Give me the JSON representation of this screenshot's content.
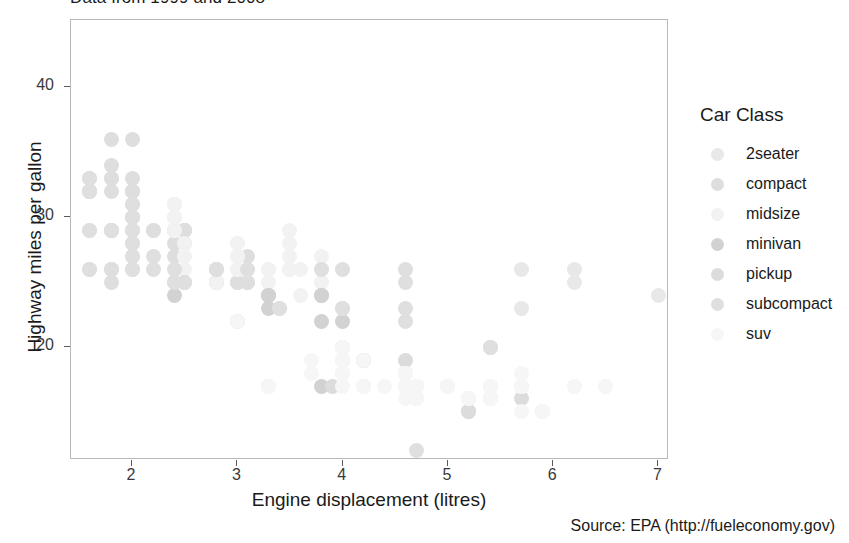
{
  "subtitle": "Data from 1999 and 2008",
  "caption": "Source: EPA (http://fueleconomy.gov)",
  "axes": {
    "xlabel": "Engine displacement (litres)",
    "ylabel": "Highway miles per gallon",
    "xticks": [
      "2",
      "3",
      "4",
      "5",
      "6",
      "7"
    ],
    "yticks": [
      "20",
      "30",
      "40"
    ]
  },
  "legend": {
    "title": "Car Class",
    "items": [
      {
        "label": "2seater",
        "color": "#e8e8e8"
      },
      {
        "label": "compact",
        "color": "#dedede"
      },
      {
        "label": "midsize",
        "color": "#f2f2f2"
      },
      {
        "label": "minivan",
        "color": "#d2d2d2"
      },
      {
        "label": "pickup",
        "color": "#dcdcdc"
      },
      {
        "label": "subcompact",
        "color": "#dfdfdf"
      },
      {
        "label": "suv",
        "color": "#f6f6f6"
      }
    ]
  },
  "chart_data": {
    "type": "scatter",
    "title": "",
    "subtitle": "Data from 1999 and 2008",
    "caption": "Source: EPA (http://fueleconomy.gov)",
    "xlabel": "Engine displacement (litres)",
    "ylabel": "Highway miles per gallon",
    "xlim": [
      1.42,
      7.1
    ],
    "ylim": [
      11.3,
      45.2
    ],
    "xticks": [
      2,
      3,
      4,
      5,
      6,
      7
    ],
    "yticks": [
      20,
      30,
      40
    ],
    "grid": false,
    "legend_position": "right",
    "legend_title": "Car Class",
    "color_by": "class",
    "point_alpha": 0.35,
    "series": [
      {
        "name": "2seater",
        "color": "#e8e8e8",
        "points": [
          [
            6.2,
            26
          ],
          [
            6.2,
            25
          ],
          [
            7.0,
            24
          ],
          [
            5.7,
            26
          ],
          [
            5.7,
            23
          ]
        ]
      },
      {
        "name": "compact",
        "color": "#dedede",
        "points": [
          [
            1.8,
            29
          ],
          [
            1.8,
            29
          ],
          [
            2.0,
            31
          ],
          [
            2.0,
            30
          ],
          [
            2.8,
            26
          ],
          [
            2.8,
            26
          ],
          [
            3.1,
            27
          ],
          [
            1.8,
            26
          ],
          [
            1.8,
            25
          ],
          [
            2.0,
            28
          ],
          [
            2.0,
            27
          ],
          [
            2.8,
            25
          ],
          [
            2.8,
            25
          ],
          [
            3.1,
            25
          ],
          [
            3.1,
            25
          ],
          [
            2.4,
            27
          ],
          [
            2.4,
            25
          ],
          [
            3.0,
            25
          ],
          [
            3.0,
            25
          ],
          [
            3.3,
            24
          ],
          [
            2.0,
            32
          ],
          [
            2.0,
            29
          ],
          [
            2.0,
            30
          ],
          [
            2.0,
            29
          ],
          [
            2.5,
            29
          ],
          [
            2.5,
            29
          ],
          [
            2.5,
            28
          ],
          [
            2.2,
            29
          ],
          [
            2.2,
            29
          ],
          [
            2.4,
            31
          ],
          [
            2.4,
            28
          ],
          [
            2.0,
            33
          ],
          [
            2.0,
            32
          ],
          [
            2.5,
            29
          ],
          [
            2.5,
            29
          ],
          [
            1.6,
            33
          ],
          [
            1.6,
            32
          ],
          [
            1.6,
            32
          ],
          [
            1.6,
            29
          ],
          [
            1.6,
            32
          ],
          [
            1.8,
            34
          ],
          [
            1.8,
            36
          ],
          [
            2.0,
            36
          ],
          [
            2.4,
            29
          ],
          [
            2.4,
            29
          ],
          [
            1.8,
            33
          ],
          [
            1.8,
            33
          ],
          [
            1.8,
            32
          ],
          [
            2.0,
            32
          ]
        ]
      },
      {
        "name": "midsize",
        "color": "#f2f2f2",
        "points": [
          [
            2.4,
            31
          ],
          [
            3.0,
            26
          ],
          [
            3.5,
            29
          ],
          [
            2.4,
            31
          ],
          [
            3.0,
            27
          ],
          [
            3.5,
            28
          ],
          [
            2.4,
            29
          ],
          [
            2.4,
            29
          ],
          [
            3.0,
            28
          ],
          [
            3.0,
            27
          ],
          [
            3.5,
            26
          ],
          [
            2.4,
            30
          ],
          [
            2.4,
            31
          ],
          [
            3.1,
            26
          ],
          [
            3.8,
            26
          ],
          [
            3.8,
            27
          ],
          [
            2.5,
            26
          ],
          [
            2.5,
            27
          ],
          [
            2.8,
            26
          ],
          [
            2.8,
            25
          ],
          [
            3.3,
            26
          ],
          [
            3.3,
            26
          ],
          [
            2.4,
            31
          ],
          [
            2.4,
            30
          ],
          [
            3.0,
            28
          ],
          [
            3.0,
            27
          ],
          [
            3.3,
            25
          ],
          [
            3.5,
            27
          ],
          [
            3.6,
            26
          ],
          [
            2.4,
            30
          ],
          [
            2.4,
            31
          ],
          [
            3.0,
            27
          ],
          [
            3.0,
            26
          ],
          [
            3.5,
            26
          ],
          [
            3.8,
            25
          ],
          [
            2.0,
            29
          ],
          [
            2.8,
            26
          ],
          [
            2.8,
            26
          ],
          [
            3.6,
            24
          ],
          [
            2.4,
            30
          ],
          [
            2.5,
            28
          ]
        ]
      },
      {
        "name": "minivan",
        "color": "#d2d2d2",
        "points": [
          [
            2.4,
            24
          ],
          [
            3.0,
            22
          ],
          [
            3.3,
            24
          ],
          [
            3.8,
            22
          ],
          [
            3.8,
            24
          ],
          [
            4.0,
            22
          ],
          [
            3.3,
            17
          ],
          [
            3.8,
            17
          ],
          [
            3.3,
            23
          ],
          [
            3.3,
            24
          ],
          [
            3.8,
            24
          ]
        ]
      },
      {
        "name": "pickup",
        "color": "#dcdcdc",
        "points": [
          [
            4.7,
            17
          ],
          [
            5.7,
            17
          ],
          [
            4.7,
            17
          ],
          [
            4.7,
            16
          ],
          [
            5.2,
            15
          ],
          [
            5.2,
            15
          ],
          [
            3.9,
            17
          ],
          [
            4.7,
            16
          ],
          [
            4.7,
            17
          ],
          [
            4.7,
            17
          ],
          [
            5.2,
            16
          ],
          [
            5.2,
            15
          ],
          [
            5.7,
            16
          ],
          [
            5.9,
            15
          ],
          [
            4.2,
            17
          ],
          [
            4.6,
            17
          ],
          [
            4.6,
            17
          ],
          [
            5.4,
            16
          ],
          [
            5.4,
            16
          ],
          [
            4.0,
            20
          ],
          [
            4.0,
            19
          ],
          [
            4.0,
            18
          ],
          [
            4.6,
            17
          ],
          [
            5.0,
            17
          ],
          [
            4.2,
            19
          ],
          [
            4.2,
            19
          ],
          [
            4.6,
            18
          ],
          [
            4.6,
            19
          ],
          [
            4.6,
            18
          ],
          [
            5.4,
            17
          ],
          [
            5.4,
            17
          ],
          [
            4.0,
            19
          ],
          [
            4.0,
            19
          ]
        ]
      },
      {
        "name": "subcompact",
        "color": "#dfdfdf",
        "points": [
          [
            1.8,
            29
          ],
          [
            1.8,
            29
          ],
          [
            2.0,
            31
          ],
          [
            2.0,
            30
          ],
          [
            2.8,
            26
          ],
          [
            2.8,
            26
          ],
          [
            3.1,
            26
          ],
          [
            1.6,
            33
          ],
          [
            1.6,
            32
          ],
          [
            1.6,
            32
          ],
          [
            1.6,
            29
          ],
          [
            1.6,
            32
          ],
          [
            2.2,
            26
          ],
          [
            2.2,
            27
          ],
          [
            2.4,
            26
          ],
          [
            2.4,
            25
          ],
          [
            2.0,
            28
          ],
          [
            2.0,
            27
          ],
          [
            2.5,
            25
          ],
          [
            2.5,
            25
          ],
          [
            2.5,
            25
          ],
          [
            3.8,
            26
          ],
          [
            4.0,
            23
          ],
          [
            4.6,
            23
          ],
          [
            4.6,
            22
          ],
          [
            5.4,
            20
          ],
          [
            5.4,
            20
          ],
          [
            5.4,
            20
          ],
          [
            4.0,
            26
          ],
          [
            4.0,
            23
          ],
          [
            4.6,
            26
          ],
          [
            4.6,
            25
          ],
          [
            5.4,
            17
          ],
          [
            5.4,
            16
          ],
          [
            2.0,
            26
          ],
          [
            2.0,
            26
          ],
          [
            3.4,
            23
          ],
          [
            3.4,
            23
          ],
          [
            1.6,
            26
          ],
          [
            1.6,
            26
          ],
          [
            1.8,
            26
          ],
          [
            1.8,
            26
          ],
          [
            4.7,
            12
          ],
          [
            2.0,
            29
          ]
        ]
      },
      {
        "name": "suv",
        "color": "#f6f6f6",
        "points": [
          [
            4.2,
            17
          ],
          [
            4.2,
            17
          ],
          [
            4.6,
            17
          ],
          [
            4.6,
            17
          ],
          [
            4.6,
            16
          ],
          [
            5.4,
            16
          ],
          [
            5.4,
            17
          ],
          [
            5.4,
            17
          ],
          [
            3.0,
            22
          ],
          [
            3.7,
            18
          ],
          [
            4.0,
            18
          ],
          [
            4.7,
            17
          ],
          [
            4.7,
            16
          ],
          [
            5.7,
            17
          ],
          [
            4.7,
            17
          ],
          [
            4.7,
            16
          ],
          [
            5.2,
            16
          ],
          [
            5.7,
            15
          ],
          [
            5.9,
            15
          ],
          [
            3.7,
            19
          ],
          [
            3.7,
            18
          ],
          [
            4.0,
            18
          ],
          [
            4.0,
            17
          ],
          [
            4.0,
            18
          ],
          [
            4.6,
            17
          ],
          [
            5.0,
            17
          ],
          [
            4.2,
            19
          ],
          [
            4.4,
            17
          ],
          [
            4.6,
            17
          ],
          [
            5.4,
            17
          ],
          [
            5.4,
            16
          ],
          [
            4.0,
            20
          ],
          [
            4.0,
            19
          ],
          [
            4.0,
            18
          ],
          [
            4.6,
            18
          ],
          [
            4.6,
            17
          ],
          [
            4.6,
            18
          ],
          [
            5.0,
            17
          ],
          [
            6.5,
            17
          ],
          [
            6.5,
            17
          ],
          [
            5.7,
            18
          ],
          [
            5.7,
            17
          ],
          [
            6.2,
            17
          ],
          [
            6.2,
            17
          ],
          [
            4.7,
            17
          ],
          [
            4.7,
            16
          ],
          [
            4.7,
            16
          ],
          [
            5.2,
            16
          ],
          [
            5.2,
            16
          ],
          [
            5.7,
            17
          ],
          [
            5.9,
            15
          ],
          [
            4.0,
            19
          ],
          [
            4.0,
            19
          ],
          [
            4.6,
            17
          ],
          [
            4.6,
            17
          ],
          [
            5.4,
            17
          ],
          [
            5.4,
            16
          ],
          [
            3.3,
            17
          ],
          [
            3.3,
            17
          ],
          [
            4.0,
            19
          ],
          [
            4.0,
            18
          ],
          [
            4.7,
            17
          ],
          [
            4.7,
            17
          ],
          [
            5.7,
            17
          ],
          [
            4.6,
            18
          ],
          [
            5.4,
            17
          ]
        ]
      }
    ]
  }
}
